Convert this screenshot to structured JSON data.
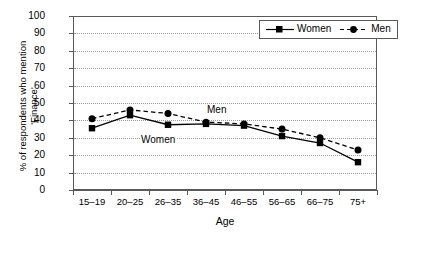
{
  "chart_data": {
    "type": "line",
    "title": "",
    "xlabel": "Age",
    "ylabel_line1": "% of respondents who mention",
    "ylabel_line2": "'Finance'",
    "categories": [
      "15–19",
      "20–25",
      "26–35",
      "36–45",
      "46–55",
      "56–65",
      "66–75",
      "75+"
    ],
    "yticks": [
      0,
      10,
      20,
      30,
      40,
      50,
      60,
      70,
      80,
      90,
      100
    ],
    "ylim": [
      0,
      100
    ],
    "grid": "horizontal-dotted",
    "legend_position": "top-right",
    "series": [
      {
        "name": "Women",
        "marker": "square",
        "line_style": "solid",
        "color": "#000000",
        "values": [
          35.5,
          43,
          37.5,
          38,
          37,
          31,
          27,
          16
        ]
      },
      {
        "name": "Men",
        "marker": "circle",
        "line_style": "dashed",
        "color": "#000000",
        "values": [
          41,
          46,
          44,
          39,
          38,
          35,
          30,
          23
        ]
      }
    ],
    "annotations": [
      {
        "text": "Men",
        "series": "Men"
      },
      {
        "text": "Women",
        "series": "Women"
      }
    ]
  },
  "legend": {
    "items": [
      {
        "label": "Women"
      },
      {
        "label": "Men"
      }
    ]
  }
}
